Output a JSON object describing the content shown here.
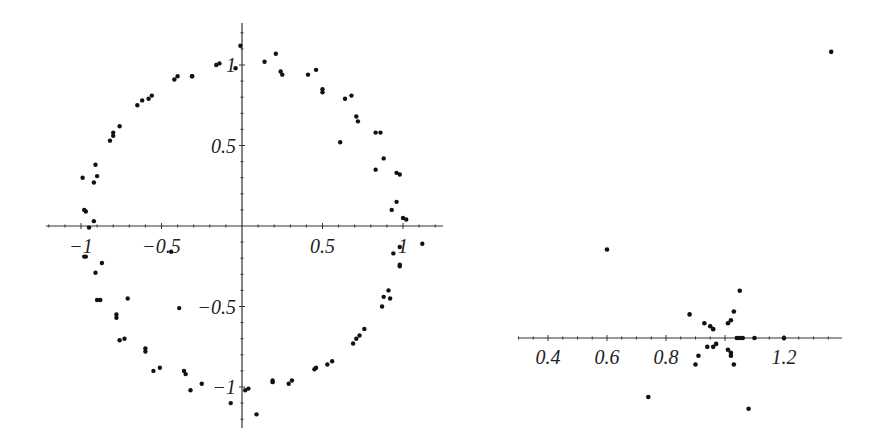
{
  "chart_data": [
    {
      "type": "scatter",
      "title": "",
      "xlabel": "",
      "ylabel": "",
      "xlim": [
        -1.21,
        1.25
      ],
      "ylim": [
        -1.25,
        1.26
      ],
      "grid": false,
      "legend": null,
      "x_ticks": [
        -1,
        -0.5,
        0.5,
        1
      ],
      "x_tick_labels": [
        "−1",
        "−0.5",
        "0.5",
        "1"
      ],
      "y_ticks": [
        1,
        0.5,
        -0.5,
        -1
      ],
      "y_tick_labels": [
        "1",
        "0.5",
        "−0.5",
        "−1"
      ],
      "axes_origin": [
        0,
        0
      ],
      "pixel_frame": {
        "origin_px": [
          242,
          226
        ],
        "scale_px": 161,
        "x_axis_px": [
          46,
          443
        ],
        "y_axis_px": [
          23,
          428
        ]
      },
      "points": [
        [
          -0.01,
          1.12
        ],
        [
          -0.04,
          0.98
        ],
        [
          -0.16,
          1.0
        ],
        [
          -0.14,
          1.01
        ],
        [
          -0.42,
          0.91
        ],
        [
          -0.4,
          0.93
        ],
        [
          -0.31,
          0.93
        ],
        [
          -0.31,
          0.93
        ],
        [
          -0.65,
          0.75
        ],
        [
          -0.62,
          0.78
        ],
        [
          -0.58,
          0.79
        ],
        [
          -0.56,
          0.81
        ],
        [
          -0.82,
          0.53
        ],
        [
          -0.8,
          0.58
        ],
        [
          -0.8,
          0.56
        ],
        [
          -0.76,
          0.62
        ],
        [
          -0.99,
          0.3
        ],
        [
          -0.92,
          0.27
        ],
        [
          -0.91,
          0.38
        ],
        [
          -0.9,
          0.31
        ],
        [
          -0.98,
          0.1
        ],
        [
          -0.97,
          0.09
        ],
        [
          -0.92,
          0.03
        ],
        [
          -0.95,
          -0.01
        ],
        [
          0.14,
          1.02
        ],
        [
          0.21,
          1.07
        ],
        [
          0.24,
          0.96
        ],
        [
          0.25,
          0.94
        ],
        [
          0.41,
          0.94
        ],
        [
          0.46,
          0.97
        ],
        [
          0.5,
          0.85
        ],
        [
          0.5,
          0.83
        ],
        [
          0.64,
          0.79
        ],
        [
          0.68,
          0.81
        ],
        [
          0.71,
          0.68
        ],
        [
          0.72,
          0.65
        ],
        [
          0.61,
          0.52
        ],
        [
          0.83,
          0.58
        ],
        [
          0.86,
          0.58
        ],
        [
          0.88,
          0.42
        ],
        [
          0.83,
          0.35
        ],
        [
          0.96,
          0.33
        ],
        [
          0.98,
          0.32
        ],
        [
          0.96,
          0.15
        ],
        [
          0.93,
          0.1
        ],
        [
          1.0,
          0.05
        ],
        [
          1.02,
          0.04
        ],
        [
          -0.98,
          -0.19
        ],
        [
          -0.97,
          -0.19
        ],
        [
          -0.87,
          -0.23
        ],
        [
          -0.91,
          -0.29
        ],
        [
          -0.9,
          -0.46
        ],
        [
          -0.88,
          -0.46
        ],
        [
          -0.71,
          -0.45
        ],
        [
          -0.78,
          -0.55
        ],
        [
          -0.78,
          -0.57
        ],
        [
          -0.76,
          -0.71
        ],
        [
          -0.73,
          -0.7
        ],
        [
          -0.6,
          -0.76
        ],
        [
          -0.6,
          -0.78
        ],
        [
          -0.44,
          -0.16
        ],
        [
          -0.39,
          -0.51
        ],
        [
          -0.55,
          -0.9
        ],
        [
          -0.51,
          -0.88
        ],
        [
          -0.36,
          -0.9
        ],
        [
          -0.35,
          -0.92
        ],
        [
          -0.32,
          -1.02
        ],
        [
          -0.25,
          -0.98
        ],
        [
          -0.07,
          -1.1
        ],
        [
          1.12,
          -0.11
        ],
        [
          0.98,
          -0.13
        ],
        [
          0.94,
          -0.17
        ],
        [
          0.98,
          -0.24
        ],
        [
          0.98,
          -0.25
        ],
        [
          0.91,
          -0.4
        ],
        [
          0.88,
          -0.44
        ],
        [
          0.92,
          -0.45
        ],
        [
          0.87,
          -0.5
        ],
        [
          0.76,
          -0.64
        ],
        [
          0.73,
          -0.68
        ],
        [
          0.71,
          -0.7
        ],
        [
          0.69,
          -0.73
        ],
        [
          0.56,
          -0.84
        ],
        [
          0.53,
          -0.86
        ],
        [
          0.45,
          -0.89
        ],
        [
          0.46,
          -0.88
        ],
        [
          0.31,
          -0.96
        ],
        [
          0.29,
          -0.98
        ],
        [
          0.19,
          -0.96
        ],
        [
          0.19,
          -0.97
        ],
        [
          0.02,
          -1.02
        ],
        [
          0.04,
          -1.01
        ],
        [
          0.09,
          -1.17
        ]
      ]
    },
    {
      "type": "scatter",
      "title": "",
      "xlabel": "",
      "ylabel": "",
      "xlim": [
        0.31,
        1.41
      ],
      "ylim": [
        -0.27,
        0.97
      ],
      "grid": false,
      "legend": null,
      "x_ticks": [
        0.4,
        0.6,
        0.8,
        1.2
      ],
      "x_tick_labels": [
        "0.4",
        "0.6",
        "0.8",
        "1.2"
      ],
      "y_ticks": [],
      "y_tick_labels": [],
      "axes_origin": [
        1.0,
        0
      ],
      "pixel_frame": {
        "x0_value": 0.4,
        "x0_px": 548,
        "axis_y_px": 338,
        "scale_px": 295,
        "x_axis_px": [
          518,
          842
        ]
      },
      "points": [
        [
          1.36,
          0.97
        ],
        [
          0.6,
          0.3
        ],
        [
          1.05,
          0.16
        ],
        [
          0.88,
          0.08
        ],
        [
          0.93,
          0.05
        ],
        [
          0.95,
          0.04
        ],
        [
          0.96,
          0.03
        ],
        [
          1.03,
          0.09
        ],
        [
          1.02,
          0.06
        ],
        [
          1.01,
          0.05
        ],
        [
          1.04,
          0.0
        ],
        [
          1.05,
          0.0
        ],
        [
          1.06,
          0.0
        ],
        [
          1.1,
          0.0
        ],
        [
          1.2,
          0.0
        ],
        [
          0.94,
          -0.03
        ],
        [
          0.96,
          -0.03
        ],
        [
          0.97,
          -0.02
        ],
        [
          0.91,
          -0.06
        ],
        [
          1.01,
          -0.04
        ],
        [
          1.02,
          -0.05
        ],
        [
          1.02,
          -0.06
        ],
        [
          1.03,
          -0.09
        ],
        [
          0.9,
          -0.09
        ],
        [
          1.08,
          -0.24
        ],
        [
          0.74,
          -0.2
        ]
      ]
    }
  ]
}
